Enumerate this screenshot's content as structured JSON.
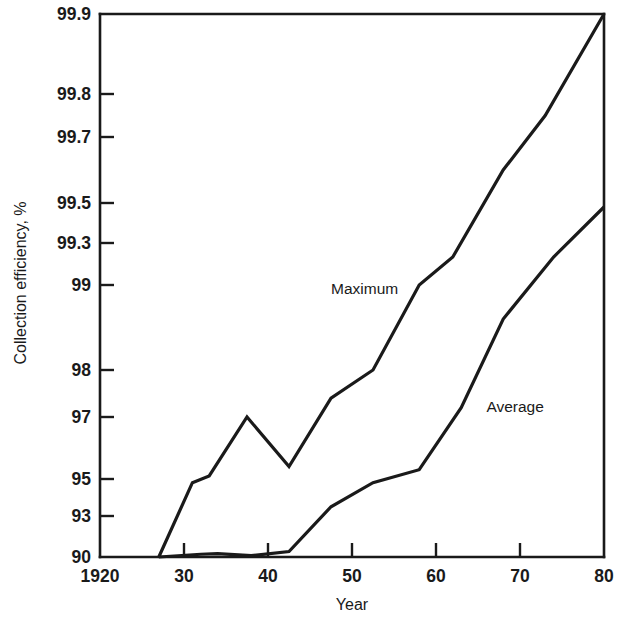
{
  "chart_data": {
    "type": "line",
    "title": "",
    "xlabel": "Year",
    "ylabel": "Collection efficiency, %",
    "xlim": [
      1920,
      1980
    ],
    "ylim": [
      90,
      99.9
    ],
    "grid": false,
    "legend_position": "inline-annotation",
    "x_tick_labels": [
      "1920",
      "30",
      "40",
      "50",
      "60",
      "70",
      "80"
    ],
    "x_tick_values": [
      1920,
      1930,
      1940,
      1950,
      1960,
      1970,
      1980
    ],
    "y_tick_labels": [
      "99.9",
      "99.8",
      "99.7",
      "99.5",
      "99.3",
      "99",
      "98",
      "97",
      "95",
      "93",
      "90"
    ],
    "y_tick_values": [
      99.9,
      99.8,
      99.7,
      99.5,
      99.3,
      99,
      98,
      97,
      95,
      93,
      90
    ],
    "y_scale": "probability",
    "series": [
      {
        "name": "Maximum",
        "label_position": {
          "x": 1947.5,
          "y": 98.9
        },
        "points": [
          {
            "x": 1927,
            "y": 90.0
          },
          {
            "x": 1931,
            "y": 94.8
          },
          {
            "x": 1933,
            "y": 95.1
          },
          {
            "x": 1937.5,
            "y": 97.0
          },
          {
            "x": 1942.5,
            "y": 95.4
          },
          {
            "x": 1947.5,
            "y": 97.4
          },
          {
            "x": 1952.5,
            "y": 98.0
          },
          {
            "x": 1958,
            "y": 99.0
          },
          {
            "x": 1962,
            "y": 99.2
          },
          {
            "x": 1968,
            "y": 99.6
          },
          {
            "x": 1973,
            "y": 99.75
          },
          {
            "x": 1980,
            "y": 99.9
          }
        ]
      },
      {
        "name": "Average",
        "label_position": {
          "x": 1966,
          "y": 97.1
        },
        "points": [
          {
            "x": 1927,
            "y": 90.0
          },
          {
            "x": 1932,
            "y": 90.2
          },
          {
            "x": 1934,
            "y": 90.25
          },
          {
            "x": 1938,
            "y": 90.1
          },
          {
            "x": 1942.5,
            "y": 90.4
          },
          {
            "x": 1947.5,
            "y": 93.5
          },
          {
            "x": 1952.5,
            "y": 94.8
          },
          {
            "x": 1958,
            "y": 95.3
          },
          {
            "x": 1963,
            "y": 97.2
          },
          {
            "x": 1968,
            "y": 98.6
          },
          {
            "x": 1974,
            "y": 99.2
          },
          {
            "x": 1980,
            "y": 99.48
          }
        ]
      }
    ]
  }
}
